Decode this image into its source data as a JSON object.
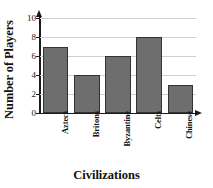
{
  "chart_data": {
    "type": "bar",
    "title": "",
    "subtitle": "",
    "xlabel": "Civilizations",
    "ylabel": "Number of Players",
    "categories": [
      "Aztecs",
      "Britons",
      "Byzantine",
      "Celts",
      "Chinese"
    ],
    "values": [
      7,
      4,
      6,
      8,
      3
    ],
    "ylim": [
      0,
      10
    ],
    "ytick_labels": [
      "0",
      "2",
      "4",
      "6",
      "8",
      "10"
    ],
    "ytick_values": [
      0,
      2,
      4,
      6,
      8,
      10
    ],
    "grid": true,
    "grid_orientation": "horizontal",
    "legend": false,
    "legend_position": "none",
    "bar_fill_color": "#6e6e6e",
    "bar_edge_color": "#333333",
    "gridline_color": "#cfcfcf",
    "axis_color": "#1a1a1a",
    "background_color": "#ffffff",
    "axis_arrows": true,
    "category_label_rotation": 90
  }
}
